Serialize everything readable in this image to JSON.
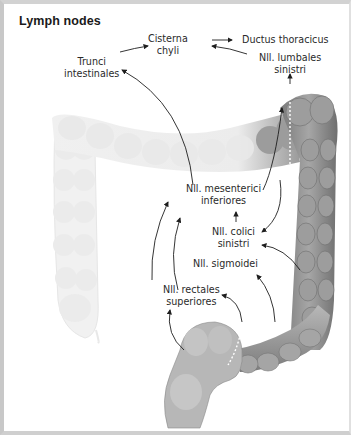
{
  "title": "Lymph nodes",
  "labels": {
    "cisterna_chyli": [
      "Cisterna",
      "chyli"
    ],
    "ductus_thoracicus": "Ductus thoracicus",
    "trunci_intestinales": [
      "Trunci",
      "intestinales"
    ],
    "nll_lumbales_sinistri": [
      "Nll. lumbales",
      "sinistri"
    ],
    "nll_mesenterici_inferiores": [
      "Nll. mesenterici",
      "inferiores"
    ],
    "nll_colici_sinistri": [
      "Nll. colici",
      "sinistri"
    ],
    "nll_sigmoidei": "Nll. sigmoidei",
    "nll_rectales_superiores": [
      "Nll. rectales",
      "superiores"
    ]
  },
  "colors": {
    "frame": "#c8c8c8",
    "text": "#2a2a2a",
    "arrow": "#1e1e1e",
    "colon_faded": "#eeeeee",
    "colon_dark": "#8a8a8a"
  }
}
